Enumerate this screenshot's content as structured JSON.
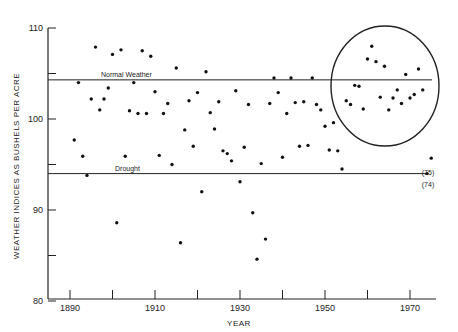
{
  "chart_data": {
    "type": "scatter",
    "title": "",
    "xlabel": "YEAR",
    "ylabel": "WEATHER INDICES AS BUSHELS PER ACRE",
    "xlim": [
      1885,
      1977
    ],
    "ylim": [
      80,
      110
    ],
    "x_ticks": [
      1890,
      1900,
      1910,
      1920,
      1930,
      1940,
      1950,
      1960,
      1970
    ],
    "x_tick_labels": [
      "1890",
      "",
      "1910",
      "",
      "1930",
      "",
      "1950",
      "",
      "1970"
    ],
    "y_ticks": [
      80,
      85,
      90,
      95,
      100,
      105,
      110
    ],
    "y_tick_labels": [
      "80",
      "",
      "90",
      "",
      "100",
      "",
      "110"
    ],
    "grid": false,
    "reference_lines": [
      {
        "name": "Normal Weather",
        "value": 104.3
      },
      {
        "name": "Drought",
        "value": 94.0
      }
    ],
    "annotations": [
      {
        "text": "(75)",
        "x": 1975,
        "y": 95.7
      },
      {
        "text": "(74)",
        "x": 1974,
        "y": 94.0
      },
      {
        "text": "circle highlighting 1955-1975 cluster",
        "center_x": 1964,
        "center_y": 103.5
      }
    ],
    "series": [
      {
        "name": "Weather index",
        "points": [
          [
            1891,
            97.7
          ],
          [
            1892,
            104.0
          ],
          [
            1893,
            95.9
          ],
          [
            1894,
            93.8
          ],
          [
            1895,
            102.2
          ],
          [
            1896,
            107.9
          ],
          [
            1897,
            101.0
          ],
          [
            1898,
            102.2
          ],
          [
            1899,
            103.4
          ],
          [
            1900,
            107.1
          ],
          [
            1901,
            88.6
          ],
          [
            1902,
            107.6
          ],
          [
            1903,
            95.9
          ],
          [
            1904,
            100.9
          ],
          [
            1905,
            104.0
          ],
          [
            1906,
            100.6
          ],
          [
            1907,
            107.5
          ],
          [
            1908,
            100.6
          ],
          [
            1909,
            106.9
          ],
          [
            1910,
            103.0
          ],
          [
            1911,
            96.0
          ],
          [
            1912,
            100.6
          ],
          [
            1913,
            101.7
          ],
          [
            1914,
            95.0
          ],
          [
            1915,
            105.6
          ],
          [
            1916,
            86.4
          ],
          [
            1917,
            98.8
          ],
          [
            1918,
            102.0
          ],
          [
            1919,
            97.0
          ],
          [
            1920,
            102.9
          ],
          [
            1921,
            92.0
          ],
          [
            1922,
            105.2
          ],
          [
            1923,
            100.7
          ],
          [
            1924,
            98.9
          ],
          [
            1925,
            101.9
          ],
          [
            1926,
            96.5
          ],
          [
            1927,
            96.2
          ],
          [
            1928,
            95.4
          ],
          [
            1929,
            103.1
          ],
          [
            1930,
            93.1
          ],
          [
            1931,
            96.9
          ],
          [
            1932,
            101.6
          ],
          [
            1933,
            89.7
          ],
          [
            1934,
            84.6
          ],
          [
            1935,
            95.1
          ],
          [
            1936,
            86.8
          ],
          [
            1937,
            101.7
          ],
          [
            1938,
            104.5
          ],
          [
            1939,
            102.9
          ],
          [
            1940,
            95.8
          ],
          [
            1941,
            100.6
          ],
          [
            1942,
            104.5
          ],
          [
            1943,
            101.8
          ],
          [
            1944,
            97.0
          ],
          [
            1945,
            101.9
          ],
          [
            1946,
            97.1
          ],
          [
            1947,
            104.5
          ],
          [
            1948,
            101.6
          ],
          [
            1949,
            101.0
          ],
          [
            1950,
            99.2
          ],
          [
            1951,
            96.6
          ],
          [
            1952,
            99.6
          ],
          [
            1953,
            96.5
          ],
          [
            1954,
            94.5
          ],
          [
            1955,
            102.0
          ],
          [
            1956,
            101.6
          ],
          [
            1957,
            103.7
          ],
          [
            1958,
            103.6
          ],
          [
            1959,
            101.1
          ],
          [
            1960,
            106.6
          ],
          [
            1961,
            108.0
          ],
          [
            1962,
            106.3
          ],
          [
            1963,
            102.4
          ],
          [
            1964,
            105.8
          ],
          [
            1965,
            101.0
          ],
          [
            1966,
            102.3
          ],
          [
            1967,
            103.2
          ],
          [
            1968,
            101.7
          ],
          [
            1969,
            104.9
          ],
          [
            1970,
            102.3
          ],
          [
            1971,
            102.7
          ],
          [
            1972,
            105.5
          ],
          [
            1973,
            103.2
          ],
          [
            1974,
            94.0
          ],
          [
            1975,
            95.7
          ]
        ]
      }
    ]
  },
  "labels": {
    "normal_line": "Normal Weather",
    "drought_line": "Drought",
    "note_75": "(75)",
    "note_74": "(74)"
  }
}
